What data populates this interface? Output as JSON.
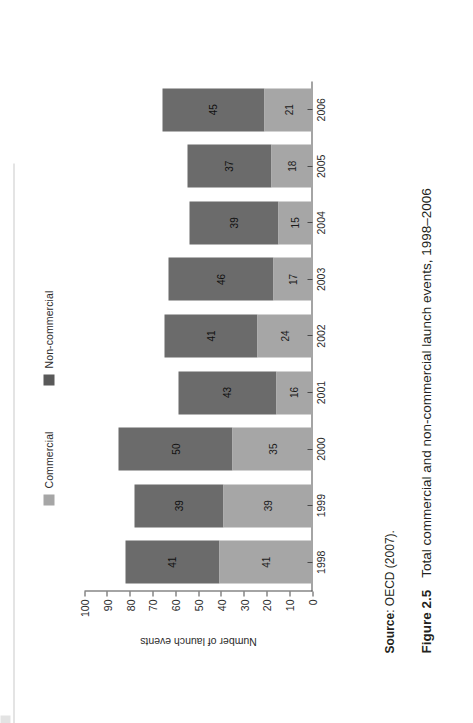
{
  "figure": {
    "number_label": "Figure 2.5",
    "title": "Total commercial and non-commercial launch events, 1998–2006",
    "source_key": "Source",
    "source_value": ": OECD (2007)."
  },
  "legend": {
    "items": [
      {
        "label": "Commercial",
        "color": "#a6a6a6",
        "icon": "legend-swatch-icon"
      },
      {
        "label": "Non-commercial",
        "color": "#595959",
        "icon": "legend-swatch-icon"
      }
    ]
  },
  "axes": {
    "y_title": "Number of launch events",
    "y_ticks": [
      "100",
      "90",
      "80",
      "70",
      "60",
      "50",
      "40",
      "30",
      "20",
      "10",
      "0"
    ]
  },
  "colors": {
    "commercial": "#a6a6a6",
    "non_commercial": "#6b6b6b",
    "axis": "#4a4a4a",
    "text": "#231f20",
    "background": "#ffffff"
  },
  "chart_data": {
    "type": "bar",
    "title": "Total commercial and non-commercial launch events, 1998–2006",
    "xlabel": "",
    "ylabel": "Number of launch events",
    "ylim": [
      0,
      100
    ],
    "stacked": true,
    "orientation": "vertical",
    "grid": false,
    "legend_position": "top",
    "categories": [
      "1998",
      "1999",
      "2000",
      "2001",
      "2002",
      "2003",
      "2004",
      "2005",
      "2006"
    ],
    "series": [
      {
        "name": "Commercial",
        "color": "#a6a6a6",
        "values": [
          41,
          39,
          35,
          16,
          24,
          17,
          15,
          18,
          21
        ]
      },
      {
        "name": "Non-commercial",
        "color": "#6b6b6b",
        "values": [
          41,
          39,
          50,
          43,
          41,
          46,
          39,
          37,
          45
        ]
      }
    ],
    "totals": [
      82,
      78,
      85,
      59,
      65,
      63,
      54,
      55,
      66
    ],
    "data_labels": true,
    "source": "OECD (2007)."
  }
}
